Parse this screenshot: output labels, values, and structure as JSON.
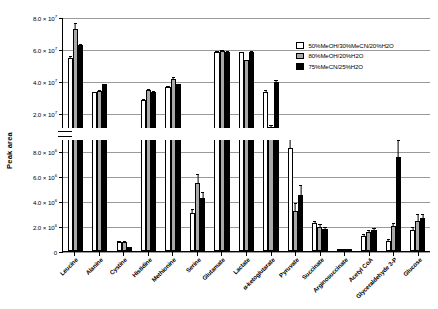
{
  "chart_data": {
    "type": "bar",
    "title": "",
    "xlabel": "",
    "ylabel": "Peak area",
    "grid": true,
    "legend_position": "top-right",
    "broken_axis": true,
    "axis_top": {
      "ylim": [
        10000000,
        80000000
      ],
      "ticks": [
        {
          "value": 20000000,
          "label": "2.0 × 10",
          "exp": "7"
        },
        {
          "value": 40000000,
          "label": "4.0 × 10",
          "exp": "7"
        },
        {
          "value": 60000000,
          "label": "6.0 × 10",
          "exp": "7"
        },
        {
          "value": 80000000,
          "label": "8.0 × 10",
          "exp": "7"
        }
      ]
    },
    "axis_bottom": {
      "ylim": [
        0,
        9000000
      ],
      "ticks": [
        {
          "value": 0,
          "label": "0",
          "exp": ""
        },
        {
          "value": 2000000,
          "label": "2.0 × 10",
          "exp": "6"
        },
        {
          "value": 4000000,
          "label": "4.0 × 10",
          "exp": "6"
        },
        {
          "value": 6000000,
          "label": "6.0 × 10",
          "exp": "6"
        },
        {
          "value": 8000000,
          "label": "8.0 × 10",
          "exp": "6"
        }
      ]
    },
    "categories": [
      "Leucine",
      "Alanine",
      "Cystine",
      "Histidine",
      "Methionine",
      "Serine",
      "Glutamate",
      "Lactate",
      "α-ketoglutarate",
      "Pyruvate",
      "Succinate",
      "Arginosuccinate",
      "Acetyl CoA",
      "Glyceraldehyde 3-P",
      "Glucose"
    ],
    "series": [
      {
        "name": "50%MeOH/30%MeCN/20%H2O",
        "color": "#ffffff",
        "values": [
          55000000,
          33500000,
          700000,
          29000000,
          37000000,
          3000000,
          59000000,
          58500000,
          34000000,
          8200000,
          2200000,
          180000,
          1200000,
          800000,
          1700000
        ],
        "errors": [
          1800000,
          1200000,
          150000,
          900000,
          1100000,
          400000,
          900000,
          900000,
          1500000,
          900000,
          300000,
          60000,
          200000,
          200000,
          300000
        ]
      },
      {
        "name": "80%MeOH/20%H2O",
        "color": "#a8a8a8",
        "values": [
          73000000,
          34500000,
          750000,
          35000000,
          42000000,
          5400000,
          59500000,
          53500000,
          12000000,
          3200000,
          1900000,
          200000,
          1500000,
          2000000,
          2400000
        ],
        "errors": [
          4500000,
          1200000,
          150000,
          1000000,
          1600000,
          800000,
          1000000,
          1200000,
          1500000,
          700000,
          300000,
          60000,
          250000,
          300000,
          600000
        ]
      },
      {
        "name": "75%MeCN/25%H2O",
        "color": "#000000",
        "values": [
          63000000,
          38500000,
          300000,
          34000000,
          38500000,
          4200000,
          59000000,
          59000000,
          40000000,
          4500000,
          1750000,
          200000,
          1700000,
          7500000,
          2600000
        ],
        "errors": [
          1400000,
          1100000,
          80000,
          900000,
          1000000,
          600000,
          900000,
          1100000,
          1600000,
          800000,
          250000,
          60000,
          250000,
          1400000,
          400000
        ]
      }
    ]
  }
}
